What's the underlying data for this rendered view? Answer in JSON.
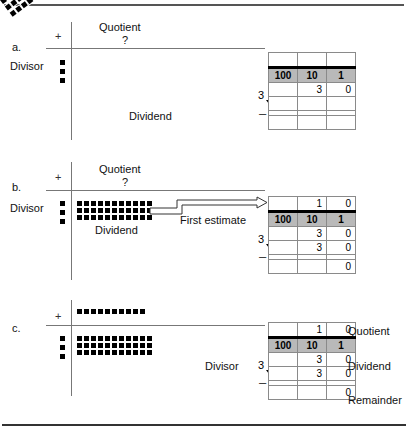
{
  "figure": {
    "panels": [
      {
        "id": "a",
        "letter": "a.",
        "plus_sign": "+",
        "quotient_label": "Quotient",
        "quotient_value": "?",
        "divisor_label": "Divisor",
        "dividend_label": "Dividend",
        "divisor_dots": 3,
        "dividend_rows": 3,
        "dividend_cols": 11,
        "dividend_tilted": true,
        "table": {
          "place_values": [
            "100",
            "10",
            "1"
          ],
          "quotient_row": [
            "",
            "",
            ""
          ],
          "dividend_row": [
            "",
            "3",
            "0"
          ],
          "subtract_row": [
            "",
            "",
            ""
          ],
          "remainder_row": [
            "",
            "",
            ""
          ],
          "divisor_digit": "3",
          "minus_sign": "–"
        }
      },
      {
        "id": "b",
        "letter": "b.",
        "plus_sign": "+",
        "quotient_label": "Quotient",
        "quotient_value": "?",
        "divisor_label": "Divisor",
        "dividend_label": "Dividend",
        "estimate_label": "First estimate",
        "divisor_dots": 3,
        "dividend_rows": 3,
        "dividend_cols": 11,
        "dividend_tilted": false,
        "table": {
          "place_values": [
            "100",
            "10",
            "1"
          ],
          "quotient_row": [
            "",
            "1",
            "0"
          ],
          "dividend_row": [
            "",
            "3",
            "0"
          ],
          "subtract_row": [
            "",
            "3",
            "0"
          ],
          "remainder_row": [
            "",
            "",
            "0"
          ],
          "divisor_digit": "3",
          "minus_sign": "–"
        }
      },
      {
        "id": "c",
        "letter": "c.",
        "plus_sign": "+",
        "divisor_label": "Divisor",
        "quotient_row_label": "Quotient",
        "dividend_row_label": "Dividend",
        "remainder_row_label": "Remainder",
        "divisor_dots": 3,
        "quotient_dots": 10,
        "dividend_rows": 3,
        "dividend_cols": 11,
        "table": {
          "place_values": [
            "100",
            "10",
            "1"
          ],
          "quotient_row": [
            "",
            "1",
            "0"
          ],
          "dividend_row": [
            "",
            "3",
            "0"
          ],
          "subtract_row": [
            "",
            "3",
            "0"
          ],
          "remainder_row": [
            "",
            "",
            "0"
          ],
          "divisor_digit": "3",
          "minus_sign": "–"
        }
      }
    ],
    "colors": {
      "ink": "#000000",
      "place_value_fill": "#b9b9b9",
      "grid_line": "#8a8a8a",
      "axis_line": "#777777",
      "rule": "#555555"
    }
  }
}
